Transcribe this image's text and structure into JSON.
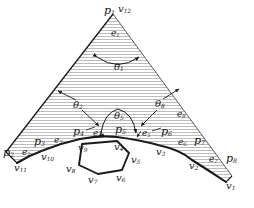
{
  "figure": {
    "type": "geometry-diagram",
    "colors": {
      "background": "#ffffff",
      "stroke": "#1a1a1a",
      "thin_stroke": "#555555",
      "hatch": "#b9b9b9",
      "label": "#1a1a1a"
    },
    "hatch": {
      "orientation": "horizontal",
      "spacing_px": 3,
      "line_width_px": 1
    }
  },
  "labels": {
    "points": [
      {
        "id": "p1",
        "base": "p",
        "sub": "1",
        "x": 104,
        "y": 11,
        "anchor": "apex-left"
      },
      {
        "id": "p2",
        "base": "p",
        "sub": "2",
        "x": 3,
        "y": 152,
        "anchor": "left-end"
      },
      {
        "id": "p3",
        "base": "p",
        "sub": "3",
        "x": 36,
        "y": 141,
        "anchor": "lower-left"
      },
      {
        "id": "p4",
        "base": "p",
        "sub": "4",
        "x": 75,
        "y": 131,
        "anchor": "lower-left-mid"
      },
      {
        "id": "p5",
        "base": "p",
        "sub": "5",
        "x": 119,
        "y": 129,
        "anchor": "center"
      },
      {
        "id": "p6",
        "base": "p",
        "sub": "6",
        "x": 163,
        "y": 131,
        "anchor": "lower-right-mid"
      },
      {
        "id": "p7",
        "base": "p",
        "sub": "7",
        "x": 196,
        "y": 140,
        "anchor": "lower-right"
      },
      {
        "id": "p8",
        "base": "p",
        "sub": "8",
        "x": 228,
        "y": 158,
        "anchor": "right-end"
      }
    ],
    "vertices": [
      {
        "id": "v1",
        "base": "v",
        "sub": "1",
        "x": 228,
        "y": 186
      },
      {
        "id": "v2",
        "base": "v",
        "sub": "2",
        "x": 191,
        "y": 166
      },
      {
        "id": "v3",
        "base": "v",
        "sub": "3",
        "x": 158,
        "y": 152
      },
      {
        "id": "v4",
        "base": "v",
        "sub": "4",
        "x": 117,
        "y": 147
      },
      {
        "id": "v5",
        "base": "v",
        "sub": "5",
        "x": 133,
        "y": 160
      },
      {
        "id": "v6",
        "base": "v",
        "sub": "6",
        "x": 118,
        "y": 177
      },
      {
        "id": "v7",
        "base": "v",
        "sub": "7",
        "x": 90,
        "y": 179
      },
      {
        "id": "v8",
        "base": "v",
        "sub": "8",
        "x": 68,
        "y": 169
      },
      {
        "id": "v9",
        "base": "v",
        "sub": "9",
        "x": 80,
        "y": 148
      },
      {
        "id": "v10",
        "base": "v",
        "sub": "10",
        "x": 43,
        "y": 156
      },
      {
        "id": "v11",
        "base": "v",
        "sub": "11",
        "x": 17,
        "y": 167
      },
      {
        "id": "v12",
        "base": "v",
        "sub": "12",
        "x": 119,
        "y": 9
      }
    ],
    "edges": [
      {
        "id": "e1",
        "base": "e",
        "sub": "1",
        "x": 112,
        "y": 34
      },
      {
        "id": "e2",
        "base": "e",
        "sub": "2",
        "x": 23,
        "y": 152
      },
      {
        "id": "e3",
        "base": "e",
        "sub": "3",
        "x": 56,
        "y": 141
      },
      {
        "id": "e4",
        "base": "e",
        "sub": "4",
        "x": 95,
        "y": 135
      },
      {
        "id": "e5",
        "base": "e",
        "sub": "5",
        "x": 144,
        "y": 135
      },
      {
        "id": "e6",
        "base": "e",
        "sub": "6",
        "x": 180,
        "y": 143
      },
      {
        "id": "e7",
        "base": "e",
        "sub": "7",
        "x": 211,
        "y": 160
      },
      {
        "id": "e8",
        "base": "e",
        "sub": "8",
        "x": 178,
        "y": 115
      }
    ],
    "angles": [
      {
        "id": "theta1",
        "base": "θ",
        "sub": "1",
        "x": 118,
        "y": 67
      },
      {
        "id": "theta2",
        "base": "θ",
        "sub": "2",
        "x": 76,
        "y": 105
      },
      {
        "id": "theta5",
        "base": "θ",
        "sub": "5",
        "x": 118,
        "y": 116
      },
      {
        "id": "theta8",
        "base": "θ",
        "sub": "8",
        "x": 157,
        "y": 104
      }
    ]
  }
}
